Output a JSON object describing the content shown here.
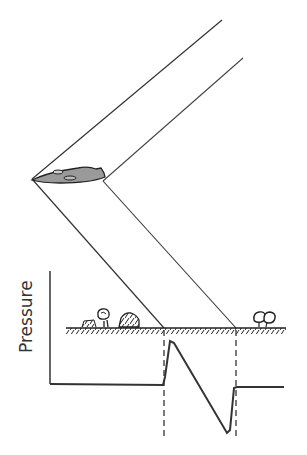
{
  "diagram": {
    "axis": {
      "ylabel": "Pressure"
    },
    "colors": {
      "ink": "#222222",
      "fill": "#9a9a9a",
      "background": "#ffffff"
    },
    "elements": {
      "aircraft": "supersonic-aircraft",
      "bow_shock": "front-shock-cone-line",
      "tail_shock": "rear-shock-cone-line",
      "ground": "hatched-ground-line",
      "objects": [
        "house-left",
        "tree-left",
        "mound",
        "trees-right"
      ],
      "waveform": "n-wave-pressure-signature"
    }
  }
}
